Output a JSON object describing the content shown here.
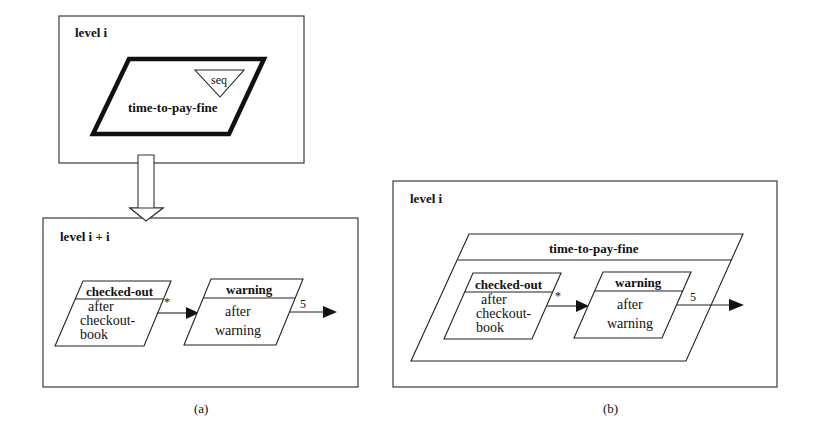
{
  "diagram_a": {
    "level_i_box": {
      "label": "level i",
      "state": {
        "name": "time-to-pay-fine",
        "badge": "seq"
      }
    },
    "level_i1_box": {
      "label": "level i + i",
      "states": [
        {
          "name": "checked-out",
          "lines": [
            "after",
            "checkout-",
            "book"
          ]
        },
        {
          "name": "warning",
          "lines": [
            "after",
            "warning"
          ]
        }
      ],
      "transitions": [
        {
          "label": "*"
        },
        {
          "label": "5"
        }
      ]
    },
    "caption": "(a)"
  },
  "diagram_b": {
    "level_box": {
      "label": "level i",
      "superstate": {
        "name": "time-to-pay-fine"
      },
      "states": [
        {
          "name": "checked-out",
          "lines": [
            "after",
            "checkout-",
            "book"
          ]
        },
        {
          "name": "warning",
          "lines": [
            "after",
            "warning"
          ]
        }
      ],
      "transitions": [
        {
          "label": "*"
        },
        {
          "label": "5"
        }
      ]
    },
    "caption": "(b)"
  }
}
